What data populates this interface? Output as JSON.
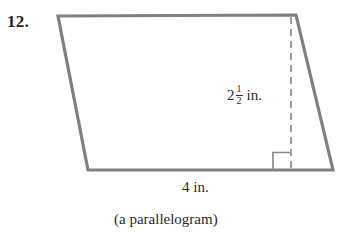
{
  "problem": {
    "number": "12."
  },
  "figure": {
    "shape_name": "parallelogram",
    "caption": "(a parallelogram)",
    "stroke_color": "#808080",
    "fill_color": "#ffffff",
    "dashed_color": "#8c8c8c",
    "text_color": "#2b2b2b"
  },
  "labels": {
    "height": {
      "whole": "2",
      "numerator": "1",
      "denominator": "2",
      "unit": "in.",
      "full_text": "2 1/2 in."
    },
    "base": {
      "full_text": "4 in.",
      "value": "4",
      "unit": "in."
    }
  },
  "geometry": {
    "vertices": {
      "top_left": [
        58,
        16
      ],
      "top_right": [
        296,
        15
      ],
      "bottom_right": [
        333,
        170
      ],
      "bottom_left": [
        88,
        170
      ]
    },
    "height_line": {
      "from": [
        291,
        16
      ],
      "to": [
        291,
        170
      ],
      "style": "dashed"
    },
    "right_angle_marker": {
      "x": 273,
      "y": 152,
      "size": 17
    }
  }
}
